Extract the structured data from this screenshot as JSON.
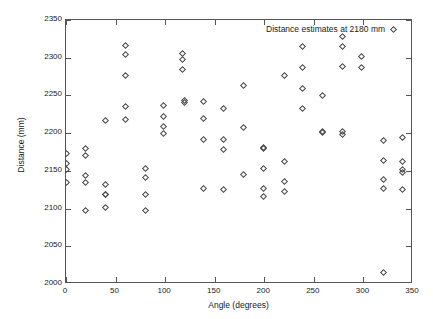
{
  "chart_data": {
    "type": "scatter",
    "title": "",
    "xlabel": "Angle (degrees)",
    "ylabel": "Distance (mm)",
    "xlim": [
      0,
      350
    ],
    "ylim": [
      2000,
      2350
    ],
    "xticks": [
      0,
      50,
      100,
      150,
      200,
      250,
      300,
      350
    ],
    "yticks": [
      2000,
      2050,
      2100,
      2150,
      2200,
      2250,
      2300,
      2350
    ],
    "xtick_labels": [
      "0",
      "50",
      "100",
      "150",
      "200",
      "250",
      "300",
      "350"
    ],
    "ytick_labels": [
      "2000",
      "2050",
      "2100",
      "2150",
      "2200",
      "2250",
      "2300",
      "2350"
    ],
    "grid": false,
    "legend_position": "top-right",
    "marker": "open-diamond",
    "marker_color": "#4a4a4a",
    "series": [
      {
        "name": "Distance estimates at 2180 mm",
        "points": [
          [
            0,
            2173
          ],
          [
            0,
            2160
          ],
          [
            0,
            2152
          ],
          [
            0,
            2135
          ],
          [
            20,
            2179
          ],
          [
            20,
            2170
          ],
          [
            20,
            2144
          ],
          [
            20,
            2134
          ],
          [
            20,
            2097
          ],
          [
            40,
            2217
          ],
          [
            40,
            2132
          ],
          [
            40,
            2119
          ],
          [
            40,
            2118
          ],
          [
            40,
            2102
          ],
          [
            60,
            2316
          ],
          [
            60,
            2304
          ],
          [
            60,
            2276
          ],
          [
            60,
            2235
          ],
          [
            60,
            2218
          ],
          [
            80,
            2153
          ],
          [
            80,
            2141
          ],
          [
            80,
            2118
          ],
          [
            80,
            2098
          ],
          [
            98,
            2236
          ],
          [
            98,
            2222
          ],
          [
            98,
            2209
          ],
          [
            98,
            2199
          ],
          [
            118,
            2305
          ],
          [
            118,
            2297
          ],
          [
            118,
            2284
          ],
          [
            120,
            2243
          ],
          [
            120,
            2241
          ],
          [
            139,
            2242
          ],
          [
            139,
            2220
          ],
          [
            139,
            2192
          ],
          [
            139,
            2126
          ],
          [
            159,
            2233
          ],
          [
            159,
            2191
          ],
          [
            159,
            2178
          ],
          [
            159,
            2125
          ],
          [
            179,
            2263
          ],
          [
            179,
            2207
          ],
          [
            179,
            2145
          ],
          [
            199,
            2181
          ],
          [
            199,
            2179
          ],
          [
            199,
            2153
          ],
          [
            199,
            2127
          ],
          [
            199,
            2116
          ],
          [
            220,
            2276
          ],
          [
            220,
            2163
          ],
          [
            220,
            2136
          ],
          [
            220,
            2123
          ],
          [
            239,
            2315
          ],
          [
            239,
            2287
          ],
          [
            239,
            2259
          ],
          [
            239,
            2233
          ],
          [
            259,
            2250
          ],
          [
            259,
            2202
          ],
          [
            259,
            2201
          ],
          [
            279,
            2328
          ],
          [
            279,
            2315
          ],
          [
            279,
            2288
          ],
          [
            279,
            2202
          ],
          [
            279,
            2198
          ],
          [
            298,
            2302
          ],
          [
            298,
            2287
          ],
          [
            320,
            2190
          ],
          [
            320,
            2164
          ],
          [
            320,
            2138
          ],
          [
            320,
            2127
          ],
          [
            320,
            2015
          ],
          [
            339,
            2194
          ],
          [
            339,
            2163
          ],
          [
            339,
            2152
          ],
          [
            339,
            2148
          ],
          [
            339,
            2125
          ]
        ]
      }
    ]
  },
  "legend": {
    "label": "Distance estimates at 2180 mm"
  },
  "axes": {
    "x_title": "Angle (degrees)",
    "y_title": "Distance (mm)"
  }
}
